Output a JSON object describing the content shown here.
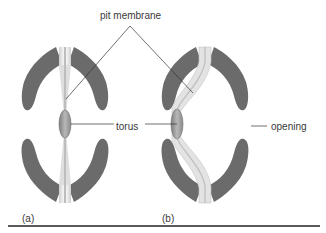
{
  "figure": {
    "labels": {
      "pit_membrane": "pit membrane",
      "torus": "torus",
      "opening": "opening"
    },
    "panels": [
      {
        "id": "a",
        "label": "(a)",
        "state": "membrane centered"
      },
      {
        "id": "b",
        "label": "(b)",
        "state": "membrane deflected, torus sealing aperture"
      }
    ],
    "colors": {
      "cell_wall": "#6b6b6b",
      "membrane_light": "#e6e6e6",
      "membrane_mid": "#c9c9c9",
      "torus": "#9a9a9a",
      "leader_line": "#333333",
      "baseline": "#222222",
      "text": "#3a3a3a"
    }
  }
}
